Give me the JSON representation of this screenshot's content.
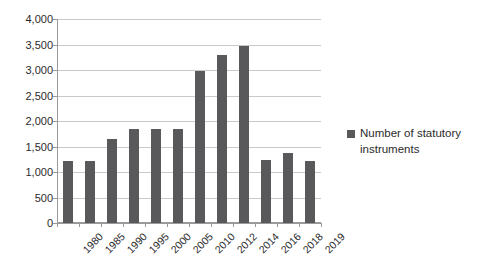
{
  "chart_data": {
    "type": "bar",
    "title": "",
    "subtitle": "",
    "xlabel": "",
    "ylabel": "",
    "categories": [
      "1980",
      "1985",
      "1990",
      "1995",
      "2000",
      "2005",
      "2010",
      "2012",
      "2014",
      "2016",
      "2018",
      "2019"
    ],
    "series": [
      {
        "name": "Number of statutory instruments",
        "color": "#59595b",
        "values": [
          1220,
          1225,
          1640,
          1845,
          1845,
          1845,
          2975,
          3300,
          3470,
          1240,
          1370,
          1215
        ]
      }
    ],
    "ylim": [
      0,
      4000
    ],
    "yticks": [
      0,
      500,
      1000,
      1500,
      2000,
      2500,
      3000,
      3500,
      4000
    ],
    "ytick_labels": [
      "0",
      "500",
      "1,000",
      "1,500",
      "2,000",
      "2,500",
      "3,000",
      "3,500",
      "4,000"
    ],
    "grid": true,
    "legend": {
      "position": "right",
      "entries": [
        {
          "label": "Number of statutory instruments",
          "color": "#59595b",
          "marker": "square-swatch"
        }
      ]
    }
  }
}
